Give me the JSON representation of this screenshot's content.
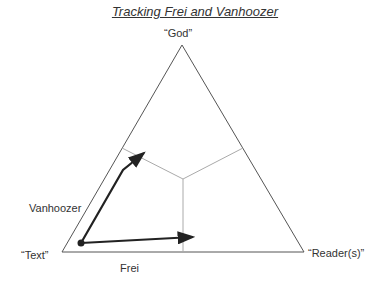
{
  "title": "Tracking Frei and Vanhoozer",
  "vertices": {
    "top": "“God”",
    "left": "“Text”",
    "right": "“Reader(s)”"
  },
  "paths": {
    "vanhoozer": "Vanhoozer",
    "frei": "Frei"
  },
  "colors": {
    "triangle": "#555555",
    "dividers": "#aaaaaa",
    "arrows": "#222222"
  }
}
